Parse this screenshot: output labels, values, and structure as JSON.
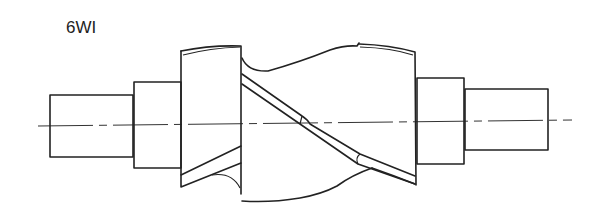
{
  "figure": {
    "label": "6WI",
    "parts": [
      "left-shaft-end",
      "left-shoulder",
      "helical-cutter-body",
      "right-shoulder",
      "right-shaft-end",
      "centerline"
    ]
  }
}
